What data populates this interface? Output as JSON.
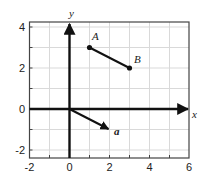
{
  "figure": {
    "type": "coordinate-plane-vectors",
    "axes": {
      "x_label": "x",
      "y_label": "y",
      "x_range": [
        -2,
        6
      ],
      "y_range": [
        -2.4,
        4.25
      ],
      "x_ticks": [
        "-2",
        "0",
        "2",
        "4",
        "6"
      ],
      "y_ticks": [
        "4",
        "2",
        "0",
        "-2"
      ],
      "grid": true,
      "grid_step": 1
    },
    "points": [
      {
        "label": "A",
        "x": 1,
        "y": 3
      },
      {
        "label": "B",
        "x": 3,
        "y": 2
      }
    ],
    "segments": [
      {
        "from": "A",
        "to": "B"
      }
    ],
    "vectors": [
      {
        "label": "a",
        "from": [
          0,
          0
        ],
        "to": [
          2,
          -1
        ]
      }
    ],
    "colors": {
      "axis": "#111111",
      "grid": "#d9d9d9",
      "frame": "#444444"
    }
  }
}
